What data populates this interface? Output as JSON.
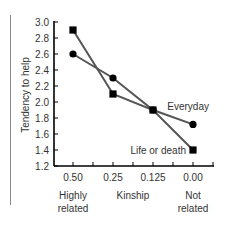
{
  "chart_data": {
    "type": "line",
    "title": "",
    "xlabel": "Kinship",
    "ylabel": "Tendency to help",
    "categories": [
      "0.50",
      "0.25",
      "0.125",
      "0.00"
    ],
    "category_sublabels": [
      {
        "index": 0,
        "lines": [
          "Highly",
          "related"
        ]
      },
      {
        "index": 3,
        "lines": [
          "Not",
          "related"
        ]
      }
    ],
    "ylim": [
      1.2,
      3.0
    ],
    "yticks": [
      "1.2",
      "1.4",
      "1.6",
      "1.8",
      "2.0",
      "2.2",
      "2.4",
      "2.6",
      "2.8",
      "3.0"
    ],
    "grid": false,
    "legend": "inline labels",
    "series": [
      {
        "name": "Everyday",
        "marker": "circle",
        "values": [
          2.6,
          2.3,
          1.9,
          1.72
        ]
      },
      {
        "name": "Life or death",
        "marker": "square",
        "values": [
          2.9,
          2.1,
          1.9,
          1.4
        ]
      }
    ],
    "colors": {
      "line": "#555555",
      "marker": "#000000",
      "axis": "#000000"
    }
  }
}
